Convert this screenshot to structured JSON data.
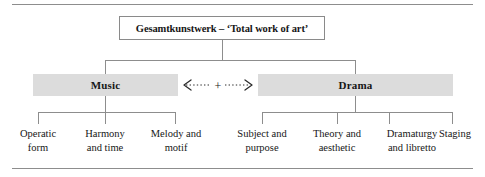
{
  "figure": {
    "root": {
      "label": "Gesamtkunstwerk – ‘Total work of art’"
    },
    "branches": [
      {
        "name": "music",
        "label": "Music",
        "leaves": [
          {
            "line1": "Operatic",
            "line2": "form"
          },
          {
            "line1": "Harmony",
            "line2": "and time"
          },
          {
            "line1": "Melody and",
            "line2": "motif"
          }
        ]
      },
      {
        "name": "drama",
        "label": "Drama",
        "leaves": [
          {
            "line1": "Subject and",
            "line2": "purpose"
          },
          {
            "line1": "Theory and",
            "line2": "aesthetic"
          },
          {
            "line1": "Dramaturgy",
            "line2": "and libretto"
          },
          {
            "line1": "Staging",
            "line2": ""
          }
        ]
      }
    ],
    "link": {
      "symbol": "+",
      "style": "dotted-double-arrow",
      "meaning": "Music + Drama"
    },
    "colors": {
      "band_fill": "#dcdcdc",
      "line": "#8d8d8d",
      "box_border": "#8a8a8a",
      "text": "#161616",
      "background": "#ffffff"
    }
  }
}
